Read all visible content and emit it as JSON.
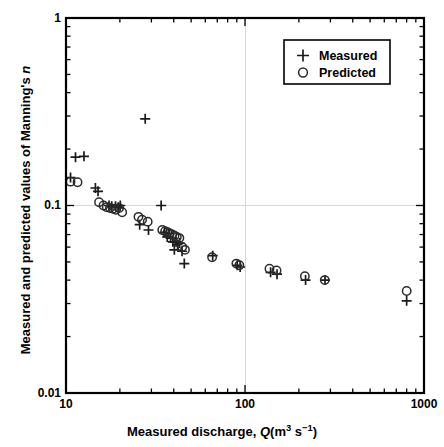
{
  "chart_data": {
    "type": "scatter",
    "title": "",
    "xlabel": "Measured discharge, Q (m3 s-1)",
    "ylabel": "Measured and predicted values of Manning's n",
    "xscale": "log",
    "yscale": "log",
    "xlim": [
      10,
      1000
    ],
    "ylim": [
      0.01,
      1
    ],
    "xticks": [
      10,
      100,
      1000
    ],
    "xtick_labels": [
      "10",
      "100",
      "1000"
    ],
    "yticks": [
      0.01,
      0.1,
      1
    ],
    "ytick_labels": [
      "0.01",
      "0.1",
      "1"
    ],
    "grid": "major gridlines at x=100 and y=0.1, light gray",
    "legend_position": "top-right inside axes",
    "series": [
      {
        "name": "Measured",
        "marker": "plus",
        "color": "#1a1a1a",
        "points": [
          [
            10.6,
            0.141
          ],
          [
            11.3,
            0.181
          ],
          [
            12.6,
            0.183
          ],
          [
            14.6,
            0.124
          ],
          [
            15.1,
            0.119
          ],
          [
            17.4,
            0.1
          ],
          [
            18.0,
            0.099
          ],
          [
            18.9,
            0.099
          ],
          [
            19.6,
            0.098
          ],
          [
            20.1,
            0.1
          ],
          [
            25.8,
            0.079
          ],
          [
            27.7,
            0.29
          ],
          [
            28.9,
            0.074
          ],
          [
            34.0,
            0.1
          ],
          [
            35.5,
            0.072
          ],
          [
            36.8,
            0.068
          ],
          [
            37.5,
            0.071
          ],
          [
            38.4,
            0.067
          ],
          [
            39.5,
            0.064
          ],
          [
            40.3,
            0.058
          ],
          [
            41.2,
            0.064
          ],
          [
            42.0,
            0.062
          ],
          [
            43.1,
            0.063
          ],
          [
            44.5,
            0.057
          ],
          [
            45.8,
            0.049
          ],
          [
            66.0,
            0.054
          ],
          [
            90.5,
            0.048
          ],
          [
            94.0,
            0.047
          ],
          [
            139.0,
            0.044
          ],
          [
            151.0,
            0.043
          ],
          [
            218.0,
            0.04
          ],
          [
            280.0,
            0.04
          ],
          [
            800.0,
            0.031
          ]
        ]
      },
      {
        "name": "Predicted",
        "marker": "circle",
        "color": "#2b2b2b",
        "points": [
          [
            10.6,
            0.134
          ],
          [
            11.6,
            0.133
          ],
          [
            15.3,
            0.104
          ],
          [
            16.2,
            0.1
          ],
          [
            16.9,
            0.098
          ],
          [
            17.6,
            0.097
          ],
          [
            18.3,
            0.096
          ],
          [
            19.0,
            0.095
          ],
          [
            19.8,
            0.097
          ],
          [
            20.6,
            0.092
          ],
          [
            25.4,
            0.087
          ],
          [
            26.6,
            0.084
          ],
          [
            28.6,
            0.082
          ],
          [
            34.5,
            0.074
          ],
          [
            35.8,
            0.073
          ],
          [
            36.9,
            0.072
          ],
          [
            38.0,
            0.071
          ],
          [
            39.2,
            0.07
          ],
          [
            40.4,
            0.069
          ],
          [
            41.6,
            0.068
          ],
          [
            43.0,
            0.067
          ],
          [
            44.6,
            0.06
          ],
          [
            46.2,
            0.058
          ],
          [
            65.5,
            0.053
          ],
          [
            89.5,
            0.049
          ],
          [
            93.0,
            0.048
          ],
          [
            137.0,
            0.046
          ],
          [
            150.0,
            0.045
          ],
          [
            216.0,
            0.042
          ],
          [
            279.0,
            0.04
          ],
          [
            800.0,
            0.035
          ]
        ]
      }
    ]
  },
  "legend": {
    "items": [
      {
        "label": "Measured",
        "marker": "plus"
      },
      {
        "label": "Predicted",
        "marker": "circle"
      }
    ]
  },
  "axes": {
    "x_title_parts": {
      "main": "Measured discharge,",
      "symbol": "Q",
      "units_open": "(m",
      "units_sup1": "3",
      "units_mid": " s",
      "units_sup2": "−1",
      "units_close": ")"
    },
    "y_title_parts": {
      "main": "Measured and predicted values of Manning's",
      "symbol": "n"
    }
  }
}
